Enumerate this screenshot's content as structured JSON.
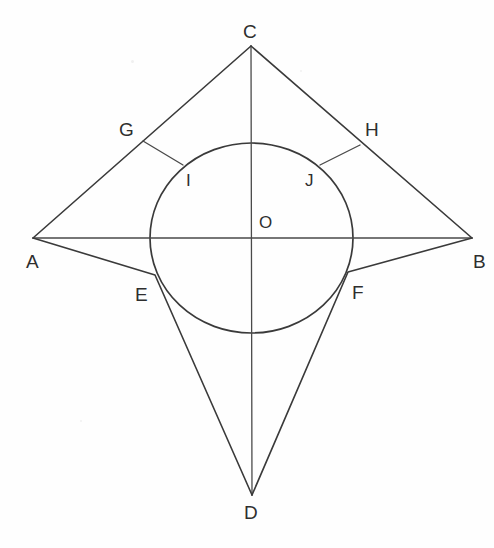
{
  "figure": {
    "background_color": "#fefefe",
    "stroke_color": "#3a3a3a",
    "width": 494,
    "height": 548
  },
  "labels": {
    "A": "A",
    "B": "B",
    "C": "C",
    "D": "D",
    "E": "E",
    "F": "F",
    "G": "G",
    "H": "H",
    "I": "I",
    "J": "J",
    "O": "O"
  },
  "geometry": {
    "points": {
      "A": {
        "x": 33,
        "y": 238,
        "label_x": 26,
        "label_y": 252,
        "role": "left-vertex"
      },
      "B": {
        "x": 472,
        "y": 238,
        "label_x": 473,
        "label_y": 252,
        "role": "right-vertex"
      },
      "C": {
        "x": 251,
        "y": 46,
        "label_x": 243,
        "label_y": 22,
        "role": "top-vertex"
      },
      "D": {
        "x": 252,
        "y": 495,
        "label_x": 244,
        "label_y": 503,
        "role": "bottom-vertex"
      },
      "E": {
        "x": 155,
        "y": 275,
        "label_x": 135,
        "label_y": 285,
        "role": "lower-left-tangent"
      },
      "F": {
        "x": 348,
        "y": 272,
        "label_x": 352,
        "label_y": 283,
        "role": "lower-right-tangent"
      },
      "G": {
        "x": 143,
        "y": 141,
        "label_x": 119,
        "label_y": 120,
        "role": "upper-left-point"
      },
      "H": {
        "x": 360,
        "y": 145,
        "label_x": 365,
        "label_y": 120,
        "role": "upper-right-point"
      },
      "I": {
        "x": 183,
        "y": 165,
        "label_x": 186,
        "label_y": 172,
        "role": "upper-left-tangent"
      },
      "J": {
        "x": 320,
        "y": 165,
        "label_x": 305,
        "label_y": 172,
        "role": "upper-right-tangent"
      },
      "O": {
        "x": 252,
        "y": 238,
        "label_x": 259,
        "label_y": 214,
        "role": "circle-center"
      }
    },
    "circle": {
      "cx": 251.5,
      "cy": 238,
      "rx": 101.5,
      "ry": 95
    },
    "segments": [
      {
        "name": "A-C",
        "from": "A",
        "to": "C"
      },
      {
        "name": "C-B",
        "from": "C",
        "to": "B"
      },
      {
        "name": "A-E-D",
        "from": "A",
        "to": "D",
        "via": "E"
      },
      {
        "name": "B-F-D",
        "from": "B",
        "to": "D",
        "via": "F"
      },
      {
        "name": "A-B",
        "from": "A",
        "to": "B",
        "type": "diagonal"
      },
      {
        "name": "C-D",
        "from": "C",
        "to": "D",
        "type": "diagonal"
      },
      {
        "name": "G-I",
        "from": "G",
        "to": "I",
        "type": "radius-perpendicular"
      },
      {
        "name": "H-J",
        "from": "H",
        "to": "J",
        "type": "radius-perpendicular"
      }
    ]
  }
}
